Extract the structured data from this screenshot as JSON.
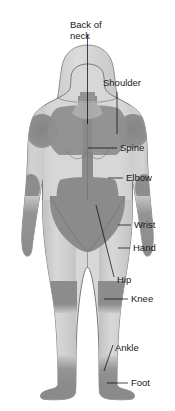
{
  "diagram": {
    "view": "posterior",
    "figure": "female-body-outline",
    "background_color": "#ffffff",
    "colors": {
      "body_light": "#d6d6d6",
      "body_mid": "#c4c4c4",
      "body_shadow": "#bdbdbd",
      "region_dark": "#8c8c8c",
      "region_dark_2": "#828282",
      "outline": "#6e6e6e",
      "leader_line": "#000000",
      "label_text": "#1a1a1a"
    },
    "labels": [
      {
        "id": "back-of-neck",
        "text_line1": "Back of",
        "text_line2": "neck",
        "text": "Back of neck",
        "x": 70,
        "y": 28,
        "leader": "vertical"
      },
      {
        "id": "shoulder",
        "text": "Shoulder",
        "x": 103,
        "y": 86,
        "leader": "vertical"
      },
      {
        "id": "spine",
        "text": "Spine",
        "x": 120,
        "y": 151,
        "leader": "horizontal"
      },
      {
        "id": "elbow",
        "text": "Elbow",
        "x": 126,
        "y": 181,
        "leader": "horizontal"
      },
      {
        "id": "wrist",
        "text": "Wrist",
        "x": 134,
        "y": 228,
        "leader": "horizontal"
      },
      {
        "id": "hand",
        "text": "Hand",
        "x": 133,
        "y": 251,
        "leader": "horizontal"
      },
      {
        "id": "hip",
        "text": "Hip",
        "x": 117,
        "y": 283,
        "leader": "diagonal"
      },
      {
        "id": "knee",
        "text": "Knee",
        "x": 131,
        "y": 302,
        "leader": "horizontal"
      },
      {
        "id": "ankle",
        "text": "Ankle",
        "x": 115,
        "y": 351,
        "leader": "diagonal"
      },
      {
        "id": "foot",
        "text": "Foot",
        "x": 131,
        "y": 386,
        "leader": "horizontal"
      }
    ],
    "highlighted_regions": [
      "back-of-neck",
      "shoulder",
      "spine",
      "elbow",
      "wrist",
      "hand",
      "hip",
      "knee",
      "ankle",
      "foot"
    ]
  }
}
